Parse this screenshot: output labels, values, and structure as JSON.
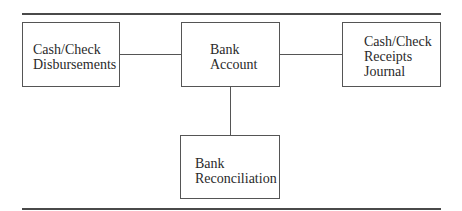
{
  "diagram": {
    "nodes": [
      {
        "id": "disbursements",
        "lines": [
          "Cash/Check",
          "Disbursements"
        ]
      },
      {
        "id": "bank-account",
        "lines": [
          "Bank",
          "Account"
        ]
      },
      {
        "id": "receipts-journal",
        "lines": [
          "Cash/Check",
          "Receipts",
          "Journal"
        ]
      },
      {
        "id": "reconciliation",
        "lines": [
          "Bank",
          "Reconciliation"
        ]
      }
    ],
    "edges": [
      {
        "from": "disbursements",
        "to": "bank-account"
      },
      {
        "from": "bank-account",
        "to": "receipts-journal"
      },
      {
        "from": "bank-account",
        "to": "reconciliation"
      }
    ]
  }
}
